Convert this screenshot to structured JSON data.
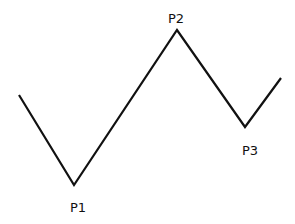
{
  "diagram": {
    "type": "zigzag-line",
    "stroke_color": "#111111",
    "background": "#ffffff",
    "points": [
      {
        "x": 19,
        "y": 95
      },
      {
        "x": 74,
        "y": 185,
        "label": "P1"
      },
      {
        "x": 177,
        "y": 30,
        "label": "P2"
      },
      {
        "x": 245,
        "y": 127,
        "label": "P3"
      },
      {
        "x": 281,
        "y": 78
      }
    ],
    "labels": {
      "p1": "P1",
      "p2": "P2",
      "p3": "P3"
    }
  }
}
